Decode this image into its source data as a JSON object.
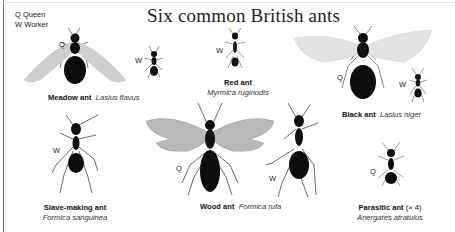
{
  "title": "Six common British ants",
  "legend": [
    {
      "code": "Q",
      "label": "Queen"
    },
    {
      "code": "W",
      "label": "Worker"
    }
  ],
  "colors": {
    "ink": "#111111",
    "wing": "#cfcfcf",
    "background": "#fefefe"
  },
  "species": [
    {
      "common": "Meadow ant",
      "latin": "Lasius flavus",
      "castes": [
        "Q",
        "W"
      ]
    },
    {
      "common": "Red ant",
      "latin": "Myrmica ruginodis",
      "castes": [
        "W"
      ]
    },
    {
      "common": "Black ant",
      "latin": "Lasius niger",
      "castes": [
        "Q",
        "W"
      ]
    },
    {
      "common": "Slave-making ant",
      "latin": "Formica sanguinea",
      "castes": [
        "W"
      ]
    },
    {
      "common": "Wood ant",
      "latin": "Formica rufa",
      "castes": [
        "Q",
        "W"
      ]
    },
    {
      "common": "Parasitic ant",
      "scale_note": "(× 4)",
      "latin": "Anergates atratulus",
      "castes": [
        "Q"
      ]
    }
  ]
}
